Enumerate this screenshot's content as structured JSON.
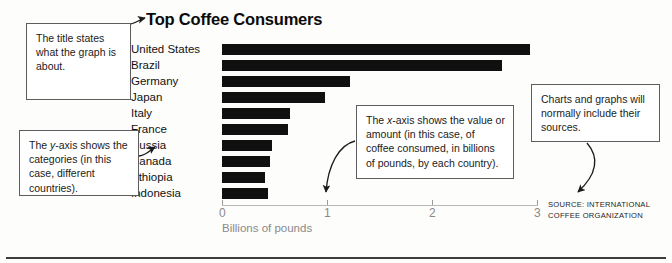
{
  "chart_data": {
    "type": "bar",
    "orientation": "horizontal",
    "title": "Top Coffee Consumers",
    "xlabel": "Billions of pounds",
    "ylabel": "",
    "xlim": [
      0,
      3
    ],
    "xticks": [
      0,
      1,
      2,
      3
    ],
    "xtick_labels": [
      "0",
      "1",
      "2",
      "3"
    ],
    "grid": false,
    "legend": null,
    "bar_color": "#101010",
    "categories": [
      "United States",
      "Brazil",
      "Germany",
      "Japan",
      "Italy",
      "France",
      "Russia",
      "Canada",
      "Ethiopia",
      "Indonesia"
    ],
    "values": [
      2.93,
      2.67,
      1.22,
      0.98,
      0.65,
      0.63,
      0.48,
      0.46,
      0.41,
      0.44
    ],
    "source": "SOURCE: INTERNATIONAL COFFEE ORGANIZATION"
  },
  "annotations": {
    "title_note": "The title states what the graph is about.",
    "yaxis_note_line1": "The ",
    "yaxis_note_em": "y",
    "yaxis_note_line2": "-axis shows the categories (in this case, different countries).",
    "xaxis_note_line1": "The ",
    "xaxis_note_em": "x",
    "xaxis_note_line2": "-axis shows the value or amount (in this case, of coffee consumed, in billions of pounds, by each country).",
    "source_note": "Charts and graphs will normally include their sources."
  },
  "source_credit": {
    "line1": "SOURCE: INTERNATIONAL",
    "line2": "COFFEE ORGANIZATION"
  }
}
